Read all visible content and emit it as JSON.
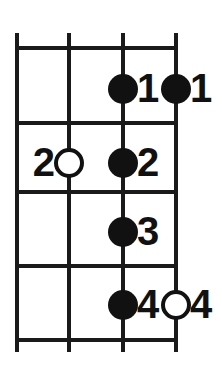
{
  "diagram": {
    "kind": "guitar-fretboard-chord-diagram",
    "colors": {
      "ink": "#1a1a1a",
      "marker_fill": "#111111",
      "background": "#ffffff"
    },
    "grid": {
      "string_count": 4,
      "fret_space_count": 4,
      "string_x": [
        17,
        69,
        123,
        176
      ],
      "fret_y": [
        48,
        123,
        192,
        266,
        340
      ],
      "string_top": 33,
      "string_bottom": 352,
      "line_thickness": 4
    },
    "markers": [
      {
        "id": "marker-f1-s3",
        "string_index": 2,
        "fret_space": 1,
        "cx": 123,
        "cy": 89,
        "style": "filled",
        "finger": "1",
        "label_side": "right"
      },
      {
        "id": "marker-f1-s4",
        "string_index": 3,
        "fret_space": 1,
        "cx": 176,
        "cy": 89,
        "style": "filled",
        "finger": "1",
        "label_side": "right"
      },
      {
        "id": "marker-f2-s2",
        "string_index": 1,
        "fret_space": 2,
        "cx": 69,
        "cy": 163,
        "style": "open",
        "finger": "2",
        "label_side": "left"
      },
      {
        "id": "marker-f2-s3",
        "string_index": 2,
        "fret_space": 2,
        "cx": 123,
        "cy": 163,
        "style": "filled",
        "finger": "2",
        "label_side": "right"
      },
      {
        "id": "marker-f3-s3",
        "string_index": 2,
        "fret_space": 3,
        "cx": 123,
        "cy": 232,
        "style": "filled",
        "finger": "3",
        "label_side": "right"
      },
      {
        "id": "marker-f4-s3",
        "string_index": 2,
        "fret_space": 4,
        "cx": 123,
        "cy": 305,
        "style": "filled",
        "finger": "4",
        "label_side": "right"
      },
      {
        "id": "marker-f4-s4",
        "string_index": 3,
        "fret_space": 4,
        "cx": 176,
        "cy": 305,
        "style": "open",
        "finger": "4",
        "label_side": "right"
      }
    ]
  }
}
